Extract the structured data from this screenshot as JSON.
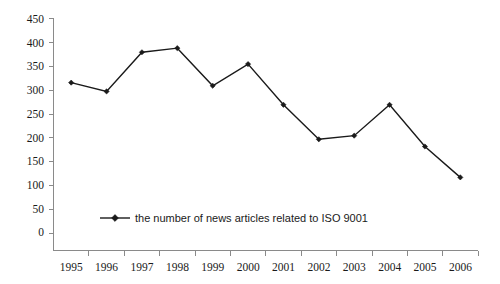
{
  "chart_data": {
    "type": "line",
    "title": "",
    "subtitle": "",
    "xlabel": "",
    "ylabel": "",
    "categories": [
      "1995",
      "1996",
      "1997",
      "1998",
      "1999",
      "2000",
      "2001",
      "2002",
      "2003",
      "2004",
      "2005",
      "2006"
    ],
    "series": [
      {
        "name": "the number of news articles related to ISO 9001",
        "values": [
          326,
          309,
          385,
          393,
          320,
          362,
          283,
          216,
          223,
          283,
          202,
          142
        ],
        "color": "#1a1a1a",
        "marker": "diamond"
      }
    ],
    "ylim": [
      0,
      450
    ],
    "yticks": [
      0,
      50,
      100,
      150,
      200,
      250,
      300,
      350,
      400,
      450
    ],
    "ytick_labels": [
      "0",
      "50",
      "100",
      "150",
      "200",
      "250",
      "300",
      "350",
      "400",
      "450"
    ],
    "grid": false,
    "legend": {
      "position": "inside-lower-left",
      "entries": [
        "the number of news articles related to ISO 9001"
      ]
    },
    "axis_color": "#8a8a8a",
    "background": "#ffffff"
  },
  "legend": {
    "label": "the number of news articles related to ISO 9001"
  },
  "axes": {
    "y_tick_labels": [
      "450",
      "400",
      "350",
      "300",
      "250",
      "200",
      "150",
      "100",
      "50",
      "0"
    ],
    "x_tick_labels": [
      "1995",
      "1996",
      "1997",
      "1998",
      "1999",
      "2000",
      "2001",
      "2002",
      "2003",
      "2004",
      "2005",
      "2006"
    ]
  }
}
